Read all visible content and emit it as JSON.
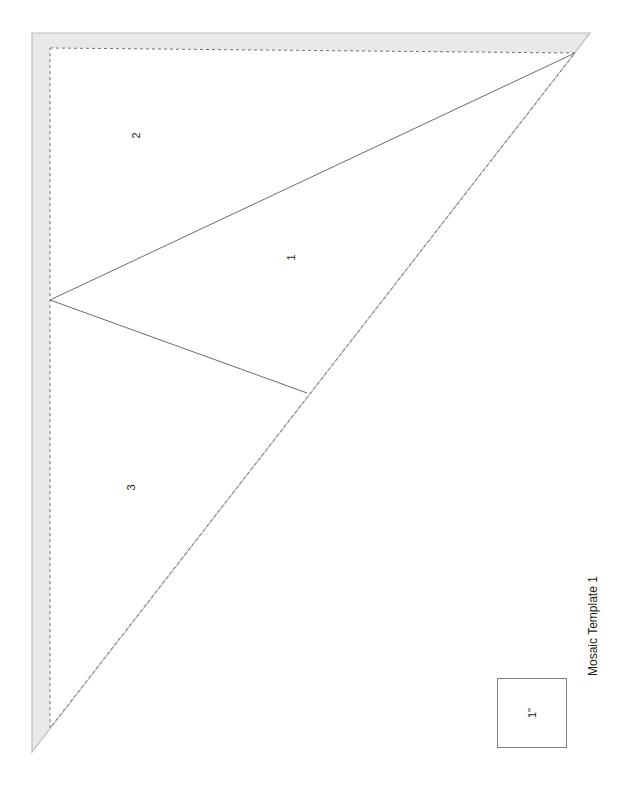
{
  "document": {
    "title": "Mosaic Template 1",
    "sheet_background": "#ffffff"
  },
  "template": {
    "name": "mosaic-triangle-template",
    "seam_allowance_fill": "#e9e9e9",
    "seam_allowance_stroke": "#c9c9c9",
    "cut_line_stroke": "#b0b0b0",
    "sew_line_stroke": "#6f6f6f",
    "piece_line_stroke": "#4a4a4a",
    "outer_cut_points": "32,33 590,33 32,752",
    "inner_sew_points": "50,48 575,53 50,728",
    "piece_divider_1": "50,300 575,53",
    "piece_divider_2": "50,300 307,393",
    "pieces": [
      {
        "id": "1",
        "label": "1",
        "x": 290,
        "y": 258
      },
      {
        "id": "2",
        "label": "2",
        "x": 135,
        "y": 136
      },
      {
        "id": "3",
        "label": "3",
        "x": 130,
        "y": 488
      }
    ]
  },
  "scale_reference": {
    "name": "one-inch-square",
    "label": "1\"",
    "border_color": "#808080",
    "size_px": 70,
    "x": 497,
    "y": 678
  },
  "caption": {
    "text": "Mosaic Template 1",
    "color": "#231f20"
  }
}
